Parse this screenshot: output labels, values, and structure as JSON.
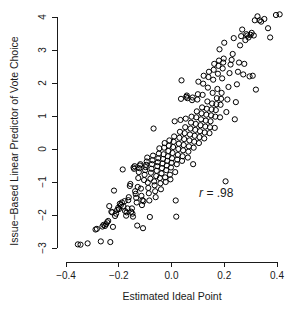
{
  "chart_data": {
    "type": "scatter",
    "title": "",
    "xlabel": "Estimated Ideal Point",
    "ylabel": "Issue−Based Linear Predictor of Vote Choice",
    "xlim": [
      -0.42,
      0.43
    ],
    "ylim": [
      -3.1,
      4.2
    ],
    "xticks": [
      -0.4,
      -0.2,
      0.0,
      0.2,
      0.4
    ],
    "xtick_labels": [
      "−0.4",
      "−0.2",
      "0.0",
      "0.2",
      "0.4"
    ],
    "yticks": [
      -3,
      -2,
      -1,
      0,
      1,
      2,
      3,
      4
    ],
    "ytick_labels": [
      "−3",
      "−2",
      "−1",
      "0",
      "1",
      "2",
      "3",
      "4"
    ],
    "grid": false,
    "legend": null,
    "marker": "open-circle",
    "marker_color": "#000000",
    "marker_radius": 2.6,
    "annotations": [
      {
        "name": "correlation-annotation",
        "text_italic": "r",
        "text_rest": " = .98",
        "x": 0.17,
        "y": -1.45
      }
    ],
    "points": [
      [
        -0.355,
        -2.89
      ],
      [
        -0.345,
        -2.9
      ],
      [
        -0.318,
        -2.86
      ],
      [
        -0.288,
        -2.44
      ],
      [
        -0.283,
        -2.42
      ],
      [
        -0.268,
        -2.8
      ],
      [
        -0.262,
        -2.35
      ],
      [
        -0.258,
        -2.3
      ],
      [
        -0.252,
        -2.33
      ],
      [
        -0.248,
        -2.28
      ],
      [
        -0.244,
        -2.22
      ],
      [
        -0.24,
        -2.18
      ],
      [
        -0.236,
        -1.73
      ],
      [
        -0.232,
        -2.82
      ],
      [
        -0.228,
        -1.9
      ],
      [
        -0.225,
        -1.92
      ],
      [
        -0.222,
        -2.36
      ],
      [
        -0.218,
        -1.26
      ],
      [
        -0.214,
        -2.03
      ],
      [
        -0.21,
        -1.96
      ],
      [
        -0.206,
        -1.85
      ],
      [
        -0.202,
        -1.78
      ],
      [
        -0.199,
        -1.82
      ],
      [
        -0.196,
        -1.66
      ],
      [
        -0.192,
        -1.7
      ],
      [
        -0.188,
        -1.62
      ],
      [
        -0.185,
        -0.62
      ],
      [
        -0.182,
        -1.74
      ],
      [
        -0.178,
        -1.58
      ],
      [
        -0.176,
        -1.88
      ],
      [
        -0.172,
        -2.02
      ],
      [
        -0.17,
        -1.92
      ],
      [
        -0.167,
        -1.8
      ],
      [
        -0.164,
        -1.55
      ],
      [
        -0.162,
        -1.46
      ],
      [
        -0.158,
        -1.12
      ],
      [
        -0.156,
        -1.06
      ],
      [
        -0.153,
        -1.9
      ],
      [
        -0.15,
        -1.8
      ],
      [
        -0.148,
        -1.96
      ],
      [
        -0.146,
        -2.05
      ],
      [
        -0.144,
        -0.56
      ],
      [
        -0.142,
        -0.6
      ],
      [
        -0.14,
        -0.52
      ],
      [
        -0.138,
        -1.28
      ],
      [
        -0.136,
        -1.36
      ],
      [
        -0.134,
        -1.48
      ],
      [
        -0.132,
        -1.62
      ],
      [
        -0.13,
        -2.32
      ],
      [
        -0.128,
        -1.15
      ],
      [
        -0.126,
        -0.88
      ],
      [
        -0.124,
        -0.7
      ],
      [
        -0.122,
        -0.58
      ],
      [
        -0.12,
        -0.5
      ],
      [
        -0.118,
        -0.46
      ],
      [
        -0.116,
        -1.2
      ],
      [
        -0.114,
        -1.42
      ],
      [
        -0.112,
        -1.7
      ],
      [
        -0.11,
        -1.55
      ],
      [
        -0.108,
        -2.4
      ],
      [
        -0.106,
        -1.58
      ],
      [
        -0.104,
        -0.94
      ],
      [
        -0.102,
        -0.78
      ],
      [
        -0.1,
        -0.64
      ],
      [
        -0.098,
        -0.55
      ],
      [
        -0.096,
        -0.48
      ],
      [
        -0.094,
        -0.38
      ],
      [
        -0.092,
        -0.26
      ],
      [
        -0.09,
        -1.02
      ],
      [
        -0.088,
        -1.18
      ],
      [
        -0.086,
        -1.34
      ],
      [
        -0.084,
        -1.56
      ],
      [
        -0.082,
        -2.06
      ],
      [
        -0.08,
        -0.9
      ],
      [
        -0.078,
        -0.72
      ],
      [
        -0.076,
        -0.6
      ],
      [
        -0.074,
        -0.46
      ],
      [
        -0.072,
        -0.34
      ],
      [
        -0.07,
        -0.2
      ],
      [
        -0.068,
        0.62
      ],
      [
        -0.066,
        -0.98
      ],
      [
        -0.064,
        -1.1
      ],
      [
        -0.062,
        -1.28
      ],
      [
        -0.06,
        -1.46
      ],
      [
        -0.058,
        -0.82
      ],
      [
        -0.056,
        -0.66
      ],
      [
        -0.054,
        -0.52
      ],
      [
        -0.052,
        -0.4
      ],
      [
        -0.05,
        -0.28
      ],
      [
        -0.048,
        -0.14
      ],
      [
        -0.046,
        0.02
      ],
      [
        -0.044,
        -0.88
      ],
      [
        -0.042,
        -1.04
      ],
      [
        -0.04,
        -1.22
      ],
      [
        -0.038,
        -0.74
      ],
      [
        -0.036,
        -0.58
      ],
      [
        -0.034,
        -0.44
      ],
      [
        -0.032,
        -0.3
      ],
      [
        -0.03,
        -0.16
      ],
      [
        -0.028,
        0.04
      ],
      [
        -0.026,
        0.18
      ],
      [
        -0.024,
        -0.86
      ],
      [
        -0.022,
        -1.0
      ],
      [
        -0.02,
        -0.64
      ],
      [
        -0.018,
        -0.5
      ],
      [
        -0.016,
        -0.36
      ],
      [
        -0.014,
        -0.22
      ],
      [
        -0.012,
        -0.06
      ],
      [
        -0.01,
        0.1
      ],
      [
        -0.008,
        0.26
      ],
      [
        -0.006,
        -0.78
      ],
      [
        -0.004,
        -0.92
      ],
      [
        -0.002,
        -0.56
      ],
      [
        0.0,
        -0.42
      ],
      [
        0.002,
        -0.28
      ],
      [
        0.004,
        -0.12
      ],
      [
        0.006,
        0.06
      ],
      [
        0.008,
        0.22
      ],
      [
        0.01,
        0.38
      ],
      [
        0.012,
        0.84
      ],
      [
        0.014,
        -0.7
      ],
      [
        0.016,
        -1.56
      ],
      [
        0.018,
        -2.05
      ],
      [
        0.02,
        -0.46
      ],
      [
        0.022,
        -0.32
      ],
      [
        0.024,
        -0.18
      ],
      [
        0.026,
        0.0
      ],
      [
        0.028,
        0.16
      ],
      [
        0.03,
        0.34
      ],
      [
        0.032,
        0.52
      ],
      [
        0.034,
        0.88
      ],
      [
        0.036,
        1.52
      ],
      [
        0.038,
        2.08
      ],
      [
        0.04,
        -0.36
      ],
      [
        0.042,
        -0.22
      ],
      [
        0.044,
        -0.04
      ],
      [
        0.046,
        0.12
      ],
      [
        0.048,
        0.3
      ],
      [
        0.05,
        0.48
      ],
      [
        0.052,
        0.66
      ],
      [
        0.054,
        0.92
      ],
      [
        0.056,
        1.58
      ],
      [
        0.058,
        1.62
      ],
      [
        0.06,
        1.54
      ],
      [
        0.062,
        -0.26
      ],
      [
        0.064,
        -0.08
      ],
      [
        0.066,
        0.08
      ],
      [
        0.068,
        0.26
      ],
      [
        0.07,
        0.44
      ],
      [
        0.072,
        0.62
      ],
      [
        0.074,
        0.8
      ],
      [
        0.076,
        0.98
      ],
      [
        0.078,
        1.48
      ],
      [
        0.08,
        1.56
      ],
      [
        0.082,
        -0.46
      ],
      [
        0.084,
        0.04
      ],
      [
        0.086,
        0.22
      ],
      [
        0.088,
        0.4
      ],
      [
        0.09,
        0.58
      ],
      [
        0.092,
        0.76
      ],
      [
        0.094,
        0.96
      ],
      [
        0.096,
        1.14
      ],
      [
        0.098,
        1.5
      ],
      [
        0.1,
        1.66
      ],
      [
        0.102,
        2.04
      ],
      [
        0.104,
        0.18
      ],
      [
        0.106,
        0.36
      ],
      [
        0.108,
        0.54
      ],
      [
        0.11,
        0.72
      ],
      [
        0.112,
        0.9
      ],
      [
        0.114,
        1.08
      ],
      [
        0.116,
        1.26
      ],
      [
        0.118,
        1.64
      ],
      [
        0.12,
        1.98
      ],
      [
        0.122,
        2.22
      ],
      [
        0.124,
        0.32
      ],
      [
        0.126,
        0.5
      ],
      [
        0.128,
        0.68
      ],
      [
        0.13,
        0.86
      ],
      [
        0.132,
        1.04
      ],
      [
        0.134,
        1.22
      ],
      [
        0.136,
        1.44
      ],
      [
        0.138,
        1.86
      ],
      [
        0.14,
        2.18
      ],
      [
        0.142,
        2.34
      ],
      [
        0.144,
        0.48
      ],
      [
        0.146,
        0.66
      ],
      [
        0.148,
        0.84
      ],
      [
        0.15,
        1.02
      ],
      [
        0.152,
        1.2
      ],
      [
        0.154,
        1.38
      ],
      [
        0.156,
        1.7
      ],
      [
        0.158,
        2.1
      ],
      [
        0.16,
        2.4
      ],
      [
        0.162,
        2.58
      ],
      [
        0.164,
        0.64
      ],
      [
        0.166,
        0.98
      ],
      [
        0.168,
        1.18
      ],
      [
        0.17,
        1.36
      ],
      [
        0.172,
        1.54
      ],
      [
        0.174,
        1.82
      ],
      [
        0.176,
        2.28
      ],
      [
        0.178,
        2.52
      ],
      [
        0.18,
        2.68
      ],
      [
        0.182,
        3.02
      ],
      [
        0.184,
        0.96
      ],
      [
        0.186,
        1.34
      ],
      [
        0.188,
        1.52
      ],
      [
        0.19,
        1.7
      ],
      [
        0.192,
        2.14
      ],
      [
        0.194,
        2.44
      ],
      [
        0.196,
        2.62
      ],
      [
        0.198,
        2.74
      ],
      [
        0.2,
        3.22
      ],
      [
        0.205,
        -0.98
      ],
      [
        0.208,
        1.12
      ],
      [
        0.212,
        1.5
      ],
      [
        0.216,
        1.88
      ],
      [
        0.22,
        2.3
      ],
      [
        0.224,
        2.56
      ],
      [
        0.228,
        2.7
      ],
      [
        0.232,
        2.88
      ],
      [
        0.236,
        3.36
      ],
      [
        0.24,
        0.9
      ],
      [
        0.244,
        1.42
      ],
      [
        0.248,
        1.96
      ],
      [
        0.252,
        2.34
      ],
      [
        0.256,
        2.62
      ],
      [
        0.26,
        3.14
      ],
      [
        0.264,
        3.42
      ],
      [
        0.268,
        3.62
      ],
      [
        0.272,
        2.26
      ],
      [
        0.276,
        2.58
      ],
      [
        0.28,
        3.3
      ],
      [
        0.284,
        3.48
      ],
      [
        0.288,
        3.44
      ],
      [
        0.292,
        3.38
      ],
      [
        0.296,
        2.2
      ],
      [
        0.3,
        3.46
      ],
      [
        0.304,
        3.52
      ],
      [
        0.308,
        2.22
      ],
      [
        0.312,
        3.44
      ],
      [
        0.316,
        3.9
      ],
      [
        0.32,
        1.8
      ],
      [
        0.326,
        4.02
      ],
      [
        0.334,
        3.9
      ],
      [
        0.34,
        3.86
      ],
      [
        0.352,
        3.94
      ],
      [
        0.366,
        3.66
      ],
      [
        0.374,
        3.38
      ],
      [
        0.396,
        4.06
      ],
      [
        0.41,
        4.08
      ]
    ]
  },
  "figure": {
    "background_color": "#ffffff",
    "axis_color": "#1a1a1a",
    "point_color": "#000000"
  }
}
